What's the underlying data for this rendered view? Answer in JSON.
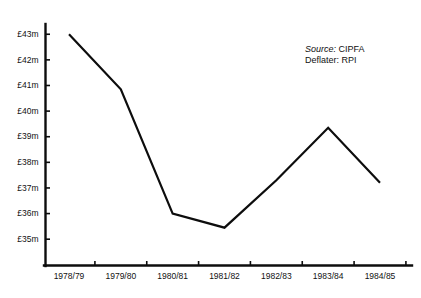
{
  "chart_data": {
    "type": "line",
    "title": "",
    "subtitle": "",
    "xlabel": "",
    "ylabel": "",
    "categories": [
      "1978/79",
      "1979/80",
      "1980/81",
      "1981/82",
      "1982/83",
      "1983/84",
      "1984/85"
    ],
    "values": [
      43.0,
      40.85,
      36.0,
      35.45,
      37.3,
      39.35,
      37.2
    ],
    "series": [
      {
        "name": "Expenditure",
        "values": [
          43.0,
          40.85,
          36.0,
          35.45,
          37.3,
          39.35,
          37.2
        ]
      }
    ],
    "ylim": [
      34.5,
      43.4
    ],
    "yticks": [
      35,
      36,
      37,
      38,
      39,
      40,
      41,
      42,
      43
    ],
    "ytick_labels": [
      "£35m",
      "£36m",
      "£37m",
      "£38m",
      "£39m",
      "£40m",
      "£41m",
      "£42m",
      "£43m"
    ],
    "grid": false,
    "legend": "none",
    "line_color": "#0d0d0d",
    "background_color": "#ffffff",
    "units": "£ million"
  },
  "annotation": {
    "source_label": "Source:",
    "source_value": "CIPFA",
    "deflater_label": "Deflater:",
    "deflater_value": "RPI"
  }
}
